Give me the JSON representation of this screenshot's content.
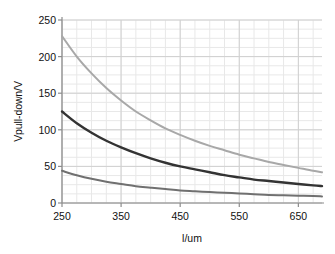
{
  "chart_data": {
    "type": "line",
    "title": "",
    "subtitle": "",
    "xlabel": "l/um",
    "ylabel": "Vpull-down/V",
    "xlim": [
      250,
      690
    ],
    "ylim": [
      0,
      250
    ],
    "xticks": [
      250,
      350,
      450,
      550,
      650
    ],
    "yticks": [
      0,
      50,
      100,
      150,
      200,
      250
    ],
    "xtick_labels": [
      "250",
      "350",
      "450",
      "550",
      "650"
    ],
    "ytick_labels": [
      "0",
      "50",
      "100",
      "150",
      "200",
      "250"
    ],
    "grid": true,
    "grid_minor_x_step": 25,
    "grid_minor_y_step": 12.5,
    "legend": "none",
    "legend_position": "none",
    "annotations": [],
    "x": [
      250,
      275,
      300,
      325,
      350,
      375,
      400,
      425,
      450,
      475,
      500,
      525,
      550,
      575,
      600,
      625,
      650,
      675,
      690
    ],
    "series": [
      {
        "name": "upper-curve",
        "color": "#a8a8a8",
        "width": 2.0,
        "values": [
          228,
          200,
          177,
          157,
          140,
          125,
          113,
          102,
          93,
          85,
          78,
          72,
          66,
          61,
          56,
          52,
          48,
          44,
          42
        ]
      },
      {
        "name": "middle-curve",
        "color": "#333333",
        "width": 2.4,
        "values": [
          125,
          109,
          96,
          85,
          76,
          68,
          61,
          55,
          50,
          46,
          42,
          38,
          35,
          32,
          30,
          28,
          26,
          24,
          23
        ]
      },
      {
        "name": "lower-curve",
        "color": "#707070",
        "width": 2.0,
        "values": [
          44,
          38,
          33,
          29,
          26,
          23,
          21,
          19,
          17,
          16,
          15,
          14,
          13,
          12,
          11,
          10.5,
          10,
          9.5,
          9
        ]
      }
    ]
  },
  "style": {
    "axis_color": "#8c8c8c",
    "grid_major_color": "#d0d0d0",
    "grid_minor_color": "#e8e8e8",
    "text_color": "#111111",
    "background": "#ffffff"
  },
  "plot_box": {
    "left": 62,
    "right": 322,
    "top": 20,
    "bottom": 203
  }
}
